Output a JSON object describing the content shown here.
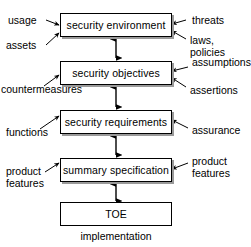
{
  "diagram": {
    "stroke_color": "#000000",
    "shadow_color": "#9a9a9a",
    "background": "#ffffff",
    "boxes": [
      {
        "id": "security-environment",
        "label": "security environment"
      },
      {
        "id": "security-objectives",
        "label": "security objectives"
      },
      {
        "id": "security-requirements",
        "label": "security requirements"
      },
      {
        "id": "summary-specification",
        "label": "summary specification"
      },
      {
        "id": "toe",
        "label": "TOE"
      }
    ],
    "left_labels": [
      {
        "id": "usage",
        "label": "usage"
      },
      {
        "id": "assets",
        "label": "assets"
      },
      {
        "id": "countermeasures",
        "label": "countermeasures"
      },
      {
        "id": "functions",
        "label": "functions"
      },
      {
        "id": "product-features-left",
        "label": "product\nfeatures"
      }
    ],
    "right_labels": [
      {
        "id": "threats",
        "label": "threats"
      },
      {
        "id": "laws-policies",
        "label": "laws, policies"
      },
      {
        "id": "assumptions",
        "label": "assumptions"
      },
      {
        "id": "assertions",
        "label": "assertions"
      },
      {
        "id": "assurance",
        "label": "assurance"
      },
      {
        "id": "product-features-right",
        "label": "product\nfeatures"
      }
    ],
    "caption": {
      "id": "implementation",
      "label": "implementation"
    }
  }
}
